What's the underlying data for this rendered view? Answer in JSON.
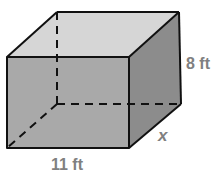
{
  "figure": {
    "type": "rectangular prism",
    "labels": {
      "height": "8 ft",
      "depth": "x",
      "length": "11 ft"
    },
    "colors": {
      "front_face": "#a9a9a9",
      "top_face": "#d6d6d6",
      "side_face": "#8c8c8c",
      "edge": "#111111",
      "label": "#808080"
    }
  }
}
